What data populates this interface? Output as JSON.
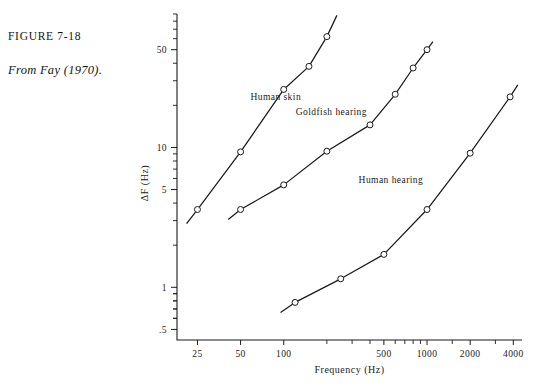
{
  "figure": {
    "caption_title": "FIGURE 7-18",
    "caption_source": "From Fay (1970)."
  },
  "chart_data": {
    "type": "line",
    "title": "",
    "xlabel": "Frequency (Hz)",
    "ylabel": "ΔF  (Hz)",
    "xscale": "log",
    "yscale": "log",
    "xlim": [
      18,
      4600
    ],
    "ylim": [
      0.42,
      90
    ],
    "grid": false,
    "legend": "inline-annotations",
    "xticks": [
      25,
      50,
      100,
      500,
      1000,
      2000,
      4000
    ],
    "xtick_labels": [
      "25",
      "50",
      "100",
      "500",
      "1000",
      "2000",
      "4000"
    ],
    "yticks": [
      0.5,
      1,
      5,
      10,
      50
    ],
    "ytick_labels": [
      ".5",
      "1",
      "5",
      "10",
      "50"
    ],
    "series": [
      {
        "name": "Human skin",
        "label": "Human skin",
        "label_x": 88,
        "label_y": 22,
        "x": [
          25,
          50,
          100,
          150,
          200
        ],
        "y": [
          3.6,
          9.3,
          26,
          38,
          62
        ],
        "line_x": [
          21,
          25,
          50,
          100,
          150,
          200,
          235
        ],
        "line_y": [
          2.85,
          3.6,
          9.3,
          26,
          38,
          62,
          88
        ]
      },
      {
        "name": "Goldfish hearing",
        "label": "Goldfish hearing",
        "label_x": 215,
        "label_y": 17,
        "x": [
          50,
          100,
          200,
          400,
          600,
          800,
          1000
        ],
        "y": [
          3.6,
          5.4,
          9.4,
          14.5,
          24,
          37,
          50
        ],
        "line_x": [
          41,
          50,
          100,
          200,
          400,
          600,
          800,
          1000,
          1100
        ],
        "line_y": [
          3.05,
          3.6,
          5.4,
          9.4,
          14.5,
          24,
          37,
          50,
          57
        ]
      },
      {
        "name": "Human hearing",
        "label": "Human hearing",
        "label_x": 560,
        "label_y": 5.6,
        "x": [
          120,
          250,
          500,
          1000,
          2000,
          3800
        ],
        "y": [
          0.78,
          1.15,
          1.72,
          3.6,
          9.1,
          23
        ],
        "line_x": [
          95,
          120,
          250,
          500,
          1000,
          2000,
          3800,
          4300
        ],
        "line_y": [
          0.66,
          0.78,
          1.15,
          1.72,
          3.6,
          9.1,
          23,
          28
        ]
      }
    ]
  }
}
